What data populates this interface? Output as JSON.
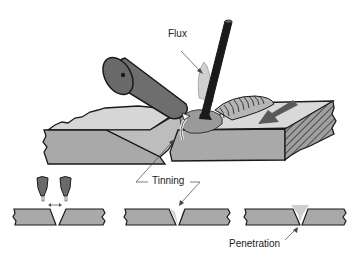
{
  "diagram": {
    "labels": {
      "flux": "Flux",
      "tinning": "Tinning",
      "penetration": "Penetration"
    },
    "colors": {
      "torch": "#6e6e6e",
      "plate_top": "#d6d6d6",
      "plate_side": "#a9a9a9",
      "bead": "#9c9c9c",
      "rod": "#1a1a1a",
      "outline": "#1a1a1a",
      "filler_light": "#cfcfcf"
    },
    "stages": [
      {
        "name": "preheat",
        "description": "Two torches heating joint edges"
      },
      {
        "name": "tinning",
        "description": "Filler flows onto bevel edges"
      },
      {
        "name": "penetration",
        "description": "Filler fills joint gap"
      }
    ]
  }
}
